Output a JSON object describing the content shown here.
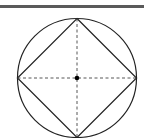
{
  "diagram": {
    "colors": {
      "stroke": "#222222",
      "bar": "#5a5a5a",
      "background": "#ffffff"
    },
    "circle": {
      "cx": 77,
      "cy": 78,
      "r": 60
    },
    "square_vertices": [
      [
        77,
        18
      ],
      [
        137,
        78
      ],
      [
        77,
        138
      ],
      [
        17,
        78
      ]
    ],
    "diagonals": "dashed",
    "center_point": {
      "x": 77,
      "y": 78
    }
  }
}
